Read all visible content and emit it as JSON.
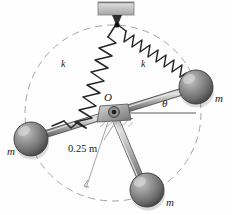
{
  "figure": {
    "background_color": "#fefefe"
  },
  "labels": {
    "mass_right": "m",
    "mass_left": "m",
    "mass_bottom": "m",
    "spring_left": "k",
    "spring_right": "k",
    "pivot": "O",
    "angle": "θ",
    "radius_dimension": "0.25 m"
  },
  "colors": {
    "sphere_dark": "#4a4a4a",
    "sphere_mid": "#7d7d7d",
    "sphere_light": "#b9b9b9",
    "rod_light": "#d2d2d2",
    "rod_mid": "#9b9b9b",
    "rod_dark": "#6a6a6a",
    "spring_stroke": "#2b2b2b",
    "dashed_circle": "#9a9a9a",
    "ceiling_fill": "#c9c9c9",
    "hatch": "#8d8d8d",
    "ink": "#1a1a1a"
  },
  "geometry": {
    "pivot": {
      "x": 113,
      "y": 113
    },
    "radius_px": 88,
    "radius_label_value": 0.25,
    "radius_units": "m",
    "ceiling_anchor": {
      "x": 115,
      "y": 24
    },
    "arm_angles_deg": [
      18,
      198,
      290
    ],
    "masses": [
      {
        "name": "mass-right",
        "x": 196,
        "y": 87,
        "r": 17
      },
      {
        "name": "mass-left",
        "x": 31,
        "y": 139,
        "r": 17
      },
      {
        "name": "mass-bottom",
        "x": 147,
        "y": 190,
        "r": 17
      }
    ],
    "springs": [
      {
        "name": "spring-left",
        "from": {
          "x": 115,
          "y": 26
        },
        "to": {
          "x": 40,
          "y": 123
        },
        "coils": 13
      },
      {
        "name": "spring-right",
        "from": {
          "x": 119,
          "y": 26
        },
        "to": {
          "x": 185,
          "y": 74
        },
        "coils": 15
      }
    ],
    "angle_reference_line": {
      "x1": 113,
      "y1": 113,
      "x2": 196,
      "y2": 113
    },
    "ceiling_bracket": {
      "x": 98,
      "y": 2,
      "width": 36,
      "height": 14
    },
    "ground_support": {
      "x": 99,
      "y": 119,
      "width": 34,
      "height": 10
    }
  }
}
